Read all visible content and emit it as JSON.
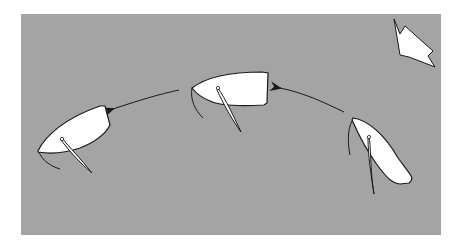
{
  "diagram": {
    "type": "sailing-maneuver",
    "description": "Dinghy bearing away sequence: three boat positions along a curved path with arrows, and a wind direction arrow at top right",
    "colors": {
      "background": "#ffffff",
      "panel": "#a4a4a4",
      "boat_fill": "#ffffff",
      "outline": "#1a1a1a"
    },
    "wind_indicator": {
      "icon": "wind-arrow-icon",
      "direction": "from top-left toward bottom-right"
    },
    "boats": [
      {
        "id": "boat-1",
        "position": "right",
        "heading": "upwind (bow up-left)",
        "order": 1
      },
      {
        "id": "boat-2",
        "position": "center",
        "heading": "beam reach (bow left)",
        "order": 2
      },
      {
        "id": "boat-3",
        "position": "left",
        "heading": "bearing away (bow down-left)",
        "order": 3
      }
    ],
    "path_arrows": [
      {
        "id": "arrow-1",
        "from": "boat-1",
        "to": "boat-2"
      },
      {
        "id": "arrow-2",
        "from": "boat-2",
        "to": "boat-3"
      }
    ]
  }
}
